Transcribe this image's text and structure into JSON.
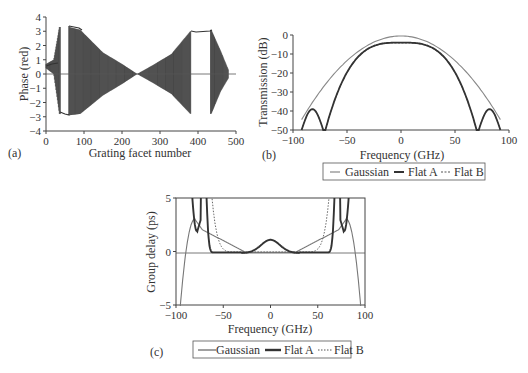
{
  "chart_data": [
    {
      "panel": "(a)",
      "type": "line",
      "title": "",
      "xlabel": "Grating facet number",
      "ylabel": "Phase (red)",
      "xlim": [
        0,
        500
      ],
      "ylim": [
        -4,
        4
      ],
      "xticks": [
        "0",
        "100",
        "200",
        "300",
        "400",
        "500"
      ],
      "yticks": [
        "4",
        "3",
        "2",
        "1",
        "0",
        "-1",
        "-2",
        "-3",
        "-4"
      ],
      "description": "Oscillating phase per facet; envelope narrows to 0 at ~240; constant segments near ±3 around facets 40-90 and 380-435",
      "envelope": {
        "x": [
          0,
          20,
          35,
          60,
          90,
          150,
          200,
          240,
          280,
          330,
          380,
          435,
          460,
          480
        ],
        "upper": [
          0.7,
          1.0,
          3.3,
          3.3,
          3.1,
          1.5,
          0.7,
          0.0,
          0.6,
          1.4,
          3.0,
          3.1,
          1.6,
          0.3
        ],
        "lower": [
          0.4,
          0.0,
          -2.8,
          -2.9,
          -2.8,
          -1.5,
          -0.7,
          0.0,
          -0.6,
          -1.4,
          -2.8,
          -2.8,
          -1.2,
          -0.3
        ]
      }
    },
    {
      "panel": "(b)",
      "type": "line",
      "xlabel": "Frequency (GHz)",
      "ylabel": "Transmission (dB)",
      "xlim": [
        -100,
        100
      ],
      "ylim": [
        -50,
        0
      ],
      "xticks": [
        "-100",
        "-50",
        "0",
        "50",
        "100"
      ],
      "yticks": [
        "0",
        "-10",
        "-20",
        "-30",
        "-40",
        "-50"
      ],
      "legend": [
        "Gaussian",
        "Flat A",
        "Flat B"
      ],
      "x": [
        -92,
        -80,
        -72,
        -70,
        -60,
        -50,
        -40,
        -30,
        -20,
        -10,
        0,
        10,
        20,
        30,
        40,
        50,
        60,
        70,
        72,
        80,
        92
      ],
      "series": [
        {
          "name": "Gaussian",
          "values": [
            -50,
            -50,
            -50,
            -42,
            -33,
            -25,
            -18,
            -12,
            -6,
            -2,
            -0.5,
            -2,
            -6,
            -12,
            -18,
            -25,
            -33,
            -38,
            -40,
            -44,
            -50
          ]
        },
        {
          "name": "Flat A",
          "values": [
            -50,
            -39,
            -50,
            -50,
            -30,
            -18,
            -11,
            -7,
            -5,
            -4.2,
            -4,
            -4.2,
            -5,
            -7,
            -11,
            -18,
            -30,
            -50,
            -50,
            -39,
            -50
          ]
        },
        {
          "name": "Flat B",
          "values": [
            -50,
            -40,
            -50,
            -50,
            -30,
            -18,
            -11,
            -7,
            -5,
            -4.3,
            -4.1,
            -4.3,
            -5,
            -7,
            -11,
            -18,
            -30,
            -50,
            -50,
            -40,
            -50
          ]
        }
      ]
    },
    {
      "panel": "(c)",
      "type": "line",
      "xlabel": "Frequency (GHz)",
      "ylabel": "Group delay (ps)",
      "xlim": [
        -100,
        100
      ],
      "ylim": [
        -5,
        5
      ],
      "xticks": [
        "-100",
        "-50",
        "0",
        "50",
        "100"
      ],
      "yticks": [
        "5",
        "0",
        "-5"
      ],
      "legend": [
        "Gaussian",
        "Flat A",
        "Flat B"
      ],
      "x": [
        -95,
        -90,
        -80,
        -75,
        -70,
        -65,
        -50,
        -30,
        -20,
        0,
        20,
        30,
        50,
        65,
        70,
        75,
        80,
        90,
        95
      ],
      "series": [
        {
          "name": "Gaussian",
          "values": [
            -5,
            0,
            3,
            2.5,
            2,
            1.5,
            1,
            0.2,
            0,
            0,
            0,
            0.2,
            1,
            1.5,
            2,
            2.5,
            3,
            0,
            -5
          ]
        },
        {
          "name": "Flat A",
          "values": [
            5,
            5,
            5,
            2,
            5,
            1,
            0.1,
            0.1,
            0.5,
            1.2,
            0.5,
            0.1,
            0.1,
            1,
            5,
            2,
            5,
            5,
            5
          ]
        },
        {
          "name": "Flat B",
          "values": [
            5,
            5,
            5,
            5,
            5,
            3,
            0.3,
            0.1,
            0.1,
            0.1,
            0.1,
            0.1,
            0.3,
            3,
            5,
            5,
            5,
            5,
            5
          ]
        }
      ]
    }
  ],
  "panels": {
    "a": {
      "label": "(a)",
      "xlabel": "Grating facet number",
      "ylabel": "Phase (red)",
      "xticks": [
        "0",
        "100",
        "200",
        "300",
        "400",
        "500"
      ],
      "yticks": [
        "4",
        "3",
        "2",
        "1",
        "0",
        "−1",
        "−2",
        "−3",
        "−4"
      ]
    },
    "b": {
      "label": "(b)",
      "xlabel": "Frequency (GHz)",
      "ylabel": "Transmission (dB)",
      "xticks": [
        "−100",
        "−50",
        "0",
        "50",
        "100"
      ],
      "yticks": [
        "0",
        "−10",
        "−20",
        "−30",
        "−40",
        "−50"
      ],
      "legend": [
        "Gaussian",
        "Flat A",
        "Flat B"
      ]
    },
    "c": {
      "label": "(c)",
      "xlabel": "Frequency (GHz)",
      "ylabel": "Group delay (ps)",
      "xticks": [
        "−100",
        "−50",
        "0",
        "50",
        "100"
      ],
      "yticks": [
        "5",
        "0",
        "−5"
      ],
      "legend": [
        "Gaussian",
        "Flat A",
        "Flat B"
      ]
    }
  },
  "colors": {
    "gaussian": "#777777",
    "flatA": "#333333",
    "flatB": "#555555",
    "axis": "#444444"
  }
}
